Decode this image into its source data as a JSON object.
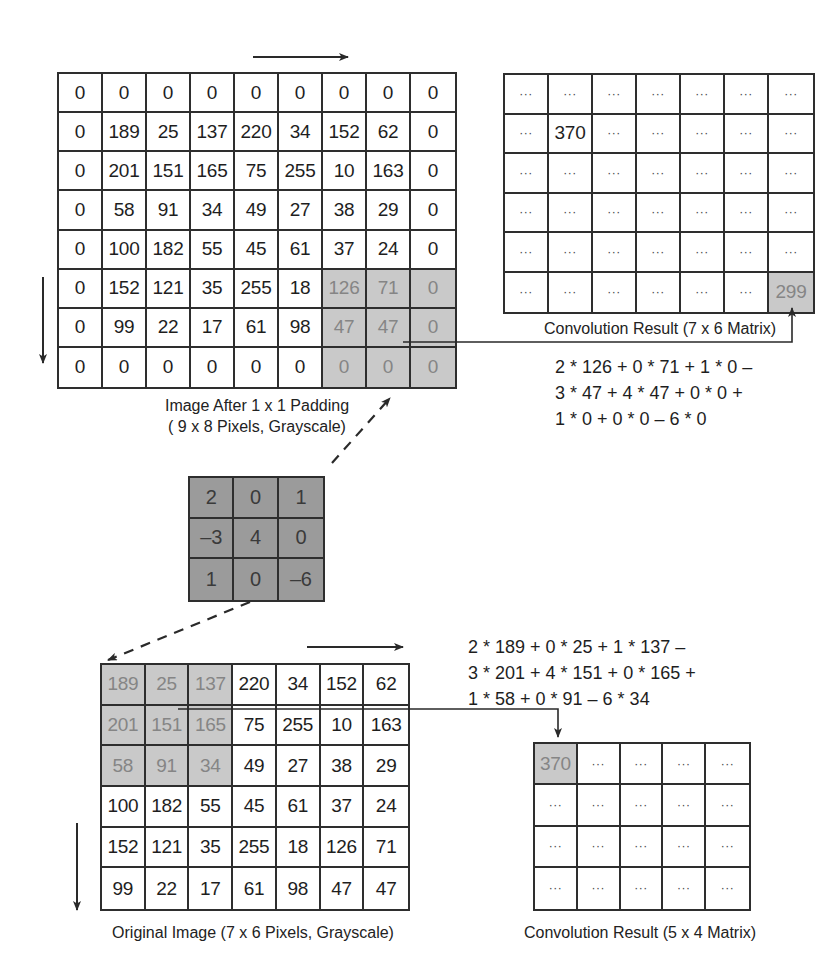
{
  "diagram": {
    "padded_image": {
      "caption_line1": "Image After 1 x 1 Padding",
      "caption_line2": "( 9 x 8 Pixels, Grayscale)",
      "rows": [
        [
          "0",
          "0",
          "0",
          "0",
          "0",
          "0",
          "0",
          "0",
          "0"
        ],
        [
          "0",
          "189",
          "25",
          "137",
          "220",
          "34",
          "152",
          "62",
          "0"
        ],
        [
          "0",
          "201",
          "151",
          "165",
          "75",
          "255",
          "10",
          "163",
          "0"
        ],
        [
          "0",
          "58",
          "91",
          "34",
          "49",
          "27",
          "38",
          "29",
          "0"
        ],
        [
          "0",
          "100",
          "182",
          "55",
          "45",
          "61",
          "37",
          "24",
          "0"
        ],
        [
          "0",
          "152",
          "121",
          "35",
          "255",
          "18",
          "126",
          "71",
          "0"
        ],
        [
          "0",
          "99",
          "22",
          "17",
          "61",
          "98",
          "47",
          "47",
          "0"
        ],
        [
          "0",
          "0",
          "0",
          "0",
          "0",
          "0",
          "0",
          "0",
          "0"
        ]
      ],
      "shaded": [
        [
          5,
          6
        ],
        [
          5,
          7
        ],
        [
          5,
          8
        ],
        [
          6,
          6
        ],
        [
          6,
          7
        ],
        [
          6,
          8
        ],
        [
          7,
          6
        ],
        [
          7,
          7
        ],
        [
          7,
          8
        ]
      ]
    },
    "padded_result": {
      "caption": "Convolution Result (7 x 6 Matrix)",
      "rows": [
        [
          "...",
          "...",
          "...",
          "...",
          "...",
          "...",
          "..."
        ],
        [
          "...",
          "370",
          "...",
          "...",
          "...",
          "...",
          "..."
        ],
        [
          "...",
          "...",
          "...",
          "...",
          "...",
          "...",
          "..."
        ],
        [
          "...",
          "...",
          "...",
          "...",
          "...",
          "...",
          "..."
        ],
        [
          "...",
          "...",
          "...",
          "...",
          "...",
          "...",
          "..."
        ],
        [
          "...",
          "...",
          "...",
          "...",
          "...",
          "...",
          "299"
        ]
      ],
      "shaded": [
        [
          5,
          6
        ]
      ]
    },
    "padded_formula": [
      "2 * 126 + 0 * 71 + 1 * 0 –",
      "3 * 47 + 4 * 47 + 0 * 0 +",
      "1 * 0 + 0 * 0 – 6 * 0"
    ],
    "kernel": {
      "rows": [
        [
          "2",
          "0",
          "1"
        ],
        [
          "–3",
          "4",
          "0"
        ],
        [
          "1",
          "0",
          "–6"
        ]
      ]
    },
    "original_image": {
      "caption": "Original Image (7 x 6 Pixels, Grayscale)",
      "rows": [
        [
          "189",
          "25",
          "137",
          "220",
          "34",
          "152",
          "62"
        ],
        [
          "201",
          "151",
          "165",
          "75",
          "255",
          "10",
          "163"
        ],
        [
          "58",
          "91",
          "34",
          "49",
          "27",
          "38",
          "29"
        ],
        [
          "100",
          "182",
          "55",
          "45",
          "61",
          "37",
          "24"
        ],
        [
          "152",
          "121",
          "35",
          "255",
          "18",
          "126",
          "71"
        ],
        [
          "99",
          "22",
          "17",
          "61",
          "98",
          "47",
          "47"
        ]
      ],
      "shaded": [
        [
          0,
          0
        ],
        [
          0,
          1
        ],
        [
          0,
          2
        ],
        [
          1,
          0
        ],
        [
          1,
          1
        ],
        [
          1,
          2
        ],
        [
          2,
          0
        ],
        [
          2,
          1
        ],
        [
          2,
          2
        ]
      ]
    },
    "original_result": {
      "caption": "Convolution Result (5 x 4 Matrix)",
      "rows": [
        [
          "370",
          "...",
          "...",
          "...",
          "..."
        ],
        [
          "...",
          "...",
          "...",
          "...",
          "..."
        ],
        [
          "...",
          "...",
          "...",
          "...",
          "..."
        ],
        [
          "...",
          "...",
          "...",
          "...",
          "..."
        ]
      ],
      "shaded": [
        [
          0,
          0
        ]
      ]
    },
    "original_formula": [
      "2 * 189 + 0 * 25 + 1 * 137 –",
      "3 * 201 + 4 * 151 + 0 * 165 +",
      "1 * 58 + 0 * 91 – 6 * 34"
    ],
    "colors": {
      "grid_line": "#2e2e2e",
      "shaded_cell": "#c9c9c9",
      "shaded_text": "#858585",
      "kernel_cell": "#9b9b9b"
    }
  }
}
